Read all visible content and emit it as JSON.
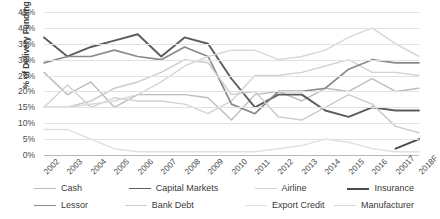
{
  "chart_data": {
    "type": "line",
    "title": "",
    "xlabel": "",
    "ylabel": "% of Delivery Funding",
    "ylim": [
      0,
      45
    ],
    "ytick_labels": [
      "0%",
      "5%",
      "10%",
      "15%",
      "20%",
      "25%",
      "30%",
      "35%",
      "40%",
      "45%"
    ],
    "ytick_values": [
      0,
      5,
      10,
      15,
      20,
      25,
      30,
      35,
      40,
      45
    ],
    "grid": true,
    "legend_position": "bottom",
    "categories": [
      "2002",
      "2003",
      "2004",
      "2005",
      "2006",
      "2007",
      "2008",
      "2009",
      "2010",
      "2011",
      "2012",
      "2013",
      "2014",
      "2015",
      "2016",
      "20017",
      "2018F"
    ],
    "series": [
      {
        "name": "Cash",
        "color": "#bdbdbd",
        "width": 1.4,
        "values": [
          26,
          19,
          23,
          15,
          19,
          19,
          19,
          18,
          11,
          19,
          20,
          17,
          21,
          20,
          24,
          20,
          21
        ]
      },
      {
        "name": "Capital Markets",
        "color": "#5c5c5c",
        "width": 1.9,
        "values": [
          37,
          31,
          34,
          36,
          38,
          31,
          37,
          35,
          24,
          15,
          19,
          19,
          14,
          12,
          15,
          14,
          14
        ]
      },
      {
        "name": "Airline",
        "color": "#d3d3d3",
        "width": 1.4,
        "values": [
          15,
          22,
          15,
          18,
          17,
          17,
          16,
          13,
          17,
          25,
          25,
          26,
          28,
          30,
          26,
          26,
          25
        ]
      },
      {
        "name": "Insurance",
        "color": "#4a4a4a",
        "width": 2.0,
        "values": [
          0,
          0,
          0,
          0,
          0,
          0,
          0,
          0,
          0,
          0,
          0,
          0,
          0,
          0,
          0,
          2,
          5
        ]
      },
      {
        "name": "Lessor",
        "color": "#8a8a8a",
        "width": 1.7,
        "values": [
          29,
          31,
          31,
          33,
          31,
          30,
          34,
          31,
          16,
          13,
          20,
          20,
          21,
          27,
          30,
          29,
          29
        ]
      },
      {
        "name": "Bank Debt",
        "color": "#cccccc",
        "width": 1.5,
        "values": [
          15,
          15,
          17,
          21,
          23,
          26,
          30,
          29,
          19,
          20,
          12,
          11,
          15,
          19,
          16,
          9,
          7
        ]
      },
      {
        "name": "Export Credit",
        "color": "#e0e0e0",
        "width": 1.5,
        "values": [
          8,
          8,
          5,
          2,
          1,
          1,
          1,
          1,
          1,
          1,
          2,
          3,
          5,
          4,
          2,
          1,
          1
        ]
      },
      {
        "name": "Manufacturer",
        "color": "#d8d8d8",
        "width": 1.5,
        "values": [
          15,
          15,
          16,
          17,
          19,
          23,
          28,
          31,
          33,
          33,
          30,
          31,
          33,
          37,
          40,
          35,
          31
        ]
      }
    ],
    "legend_rows": [
      [
        "Cash",
        "Capital Markets",
        "Airline",
        "Insurance"
      ],
      [
        "Lessor",
        "Bank Debt",
        "Export Credit",
        "Manufacturer"
      ]
    ]
  }
}
